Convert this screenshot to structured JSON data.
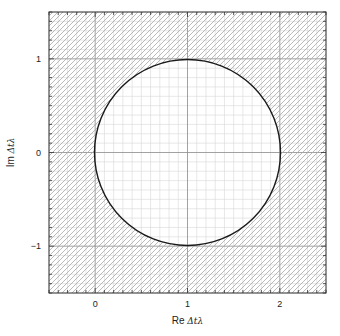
{
  "chart_data": {
    "type": "line",
    "title": "",
    "xlabel": "Re Δtλ",
    "xlabel_prefix": "Re ",
    "xlabel_symbol": "Δtλ",
    "ylabel": "Im Δtλ",
    "ylabel_prefix": "Im ",
    "ylabel_symbol": "Δtλ",
    "xlim": [
      -0.5,
      2.5
    ],
    "ylim": [
      -1.5,
      1.5
    ],
    "xticks": [
      0,
      1,
      2
    ],
    "xtick_labels": [
      "0",
      "1",
      "2"
    ],
    "yticks": [
      -1,
      0,
      1
    ],
    "ytick_labels": [
      "−1",
      "0",
      "1"
    ],
    "minor_tick_step": 0.1,
    "grid": true,
    "grid_minor_step": 0.1,
    "grid_major_step": 1,
    "legend": "none",
    "series": [
      {
        "name": "stability boundary",
        "shape": "circle",
        "center": [
          1,
          0
        ],
        "radius": 1,
        "color": "#1a1a1a"
      }
    ],
    "shaded_region": {
      "description": "outside circle",
      "pattern": "diagonal hatch",
      "color": "#b0b0b0"
    }
  }
}
